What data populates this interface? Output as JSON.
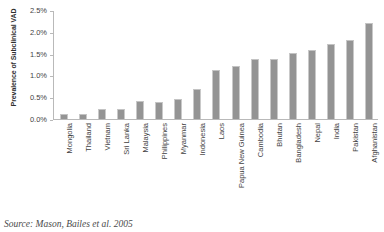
{
  "chart_data": {
    "type": "bar",
    "title": "",
    "xlabel": "",
    "ylabel": "Prevalence of Subclinical VAD",
    "ylim": [
      0,
      2.5
    ],
    "ytick_labels": [
      "2.5%",
      "2.0%",
      "1.5%",
      "1.0%",
      "0.5%",
      "0.0%"
    ],
    "ytick_values": [
      2.5,
      2.0,
      1.5,
      1.0,
      0.5,
      0.0
    ],
    "grid": false,
    "legend": null,
    "bar_color": "#949494",
    "categories": [
      "Mongolia",
      "Thailand",
      "Vietnam",
      "Sri Lanka",
      "Malaysia",
      "Philippines",
      "Myanmar",
      "Indonesia",
      "Laos",
      "Papua New Guinea",
      "Cambodia",
      "Bhutan",
      "Bangladesh",
      "Nepal",
      "India",
      "Pakistan",
      "Afghanistan"
    ],
    "values": [
      0.12,
      0.12,
      0.22,
      0.22,
      0.42,
      0.38,
      0.45,
      0.68,
      1.12,
      1.22,
      1.38,
      1.38,
      1.52,
      1.58,
      1.72,
      1.82,
      2.2
    ]
  },
  "source": {
    "caption": "Source: Mason, Bailes et al. 2005"
  }
}
